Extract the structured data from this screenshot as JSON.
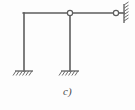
{
  "figure": {
    "caption": "c)",
    "kind": "structural-frame-diagram",
    "background_color": "#fdfdfd",
    "line_color": "#5d5d5d",
    "hatch_color": "#6a6a6a",
    "node_fill": "#ffffff"
  },
  "geometry": {
    "beam_y": 13,
    "ground_y": 71,
    "left_column_x": 24,
    "middle_column_x": 70,
    "beam_start_x": 24,
    "beam_end_x": 116,
    "wall_x": 124,
    "wall_top_y": 4,
    "wall_bottom_y": 23
  },
  "members": [
    {
      "name": "left-column",
      "label": "Left column",
      "x1": 24,
      "y1": 13,
      "x2": 24,
      "y2": 71
    },
    {
      "name": "top-beam",
      "label": "Top beam",
      "x1": 24,
      "y1": 13,
      "x2": 116,
      "y2": 13
    },
    {
      "name": "middle-column",
      "label": "Middle column",
      "x1": 70,
      "y1": 13,
      "x2": 70,
      "y2": 71
    },
    {
      "name": "right-link",
      "label": "Right link to wall",
      "x1": 116,
      "y1": 13,
      "x2": 124,
      "y2": 13
    }
  ],
  "joints": [
    {
      "name": "corner-joint-top-left",
      "label": "Rigid corner joint",
      "type": "rigid",
      "x": 24,
      "y": 13
    },
    {
      "name": "hinge-middle-top",
      "label": "Internal hinge at middle column top",
      "type": "hinge",
      "x": 70,
      "y": 13,
      "radius": 2.6
    },
    {
      "name": "hinge-right-end",
      "label": "Hinge at right wall connection",
      "type": "hinge",
      "x": 116,
      "y": 13,
      "radius": 2.6
    }
  ],
  "supports": [
    {
      "name": "support-left-fixed",
      "label": "Fixed support (left column base)",
      "type": "fixed",
      "x": 24,
      "y": 71,
      "half_width": 9,
      "orientation": "horizontal"
    },
    {
      "name": "support-middle-fixed",
      "label": "Fixed support (middle column base)",
      "type": "fixed",
      "x": 70,
      "y": 71,
      "half_width": 9,
      "orientation": "horizontal"
    },
    {
      "name": "support-right-wall",
      "label": "Wall support (right end)",
      "type": "wall",
      "x": 124,
      "y": 13,
      "half_height": 9,
      "orientation": "vertical"
    }
  ]
}
